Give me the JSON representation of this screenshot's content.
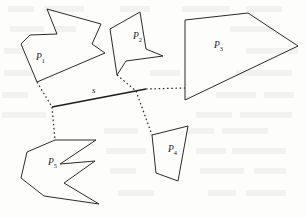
{
  "figure": {
    "caption_labels": {
      "p1": "P",
      "p1_sub": "1",
      "p2": "P",
      "p2_sub": "2",
      "p3": "P",
      "p3_sub": "3",
      "p4": "P",
      "p4_sub": "4",
      "p5": "P",
      "p5_sub": "5",
      "segment": "s"
    },
    "colors": {
      "stroke": "#2b2b2b",
      "bridge_solid": "#1d1d1d",
      "background": "#fdfdfc",
      "label": "#1a1a1a"
    },
    "polygons": [
      {
        "name": "P1",
        "label": "P",
        "subscript": "1",
        "label_x": 36,
        "label_y": 60,
        "points": "47,9 57,34 30,35 21,44 37,82 105,53 92,44 101,24"
      },
      {
        "name": "P2",
        "label": "P",
        "subscript": "2",
        "label_x": 133,
        "label_y": 39,
        "points": "140,12 110,29 117,75 126,61 163,56 146,49"
      },
      {
        "name": "P3",
        "label": "P",
        "subscript": "3",
        "label_x": 214,
        "label_y": 48,
        "points": "248,13 185,20 185,100 298,46"
      },
      {
        "name": "P4",
        "label": "P",
        "subscript": "4",
        "label_x": 168,
        "label_y": 152,
        "points": "188,126 152,135 156,173 178,181"
      },
      {
        "name": "P5",
        "label": "P",
        "subscript": "5",
        "label_x": 48,
        "label_y": 165,
        "points": "55,140 96,140 60,164 95,161 64,183 99,204 44,196 21,178 27,152"
      }
    ],
    "segment": {
      "name": "s",
      "label": "s",
      "label_x": 92,
      "label_y": 93,
      "x1": 52,
      "y1": 107,
      "x2": 146,
      "y2": 89
    },
    "bridges": [
      {
        "name": "p1-to-s",
        "style": "dotted",
        "points": "37,82 52,107"
      },
      {
        "name": "s-to-p5",
        "style": "dotted",
        "points": "52,107 55,140"
      },
      {
        "name": "p2-to-s",
        "style": "dotted",
        "points": "117,75 136,91"
      },
      {
        "name": "s-to-p4",
        "style": "dotted",
        "points": "136,91 152,135"
      },
      {
        "name": "s-to-p3",
        "style": "dotted",
        "points": "146,89 185,88"
      }
    ]
  }
}
